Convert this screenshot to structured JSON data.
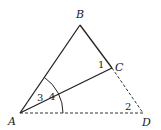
{
  "diagram": {
    "points": [
      {
        "id": "A",
        "label": "A"
      },
      {
        "id": "B",
        "label": "B"
      },
      {
        "id": "C",
        "label": "C"
      },
      {
        "id": "D",
        "label": "D"
      }
    ],
    "segments": [
      {
        "from": "A",
        "to": "B",
        "style": "solid"
      },
      {
        "from": "B",
        "to": "C",
        "style": "solid"
      },
      {
        "from": "A",
        "to": "C",
        "style": "solid"
      },
      {
        "from": "C",
        "to": "D",
        "style": "dashed"
      },
      {
        "from": "A",
        "to": "D",
        "style": "dashed"
      }
    ],
    "angles": [
      {
        "label": "1",
        "vertex": "C",
        "between": [
          "B",
          "A"
        ]
      },
      {
        "label": "2",
        "vertex": "D",
        "between": [
          "C",
          "A"
        ]
      },
      {
        "label": "3",
        "vertex": "A",
        "between": [
          "B",
          "C"
        ]
      },
      {
        "label": "4",
        "vertex": "A",
        "between": [
          "C",
          "D"
        ]
      }
    ]
  }
}
